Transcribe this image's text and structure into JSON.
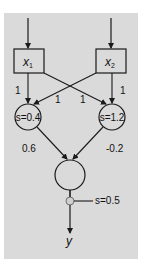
{
  "colors": {
    "panel": "#dadada",
    "line": "#1a1a1a",
    "background": "#ffffff",
    "threshold_node": "#d8d8d8"
  },
  "inputs": [
    {
      "name": "x",
      "subscript": "1"
    },
    {
      "name": "x",
      "subscript": "2"
    }
  ],
  "hidden_nodes": [
    {
      "label": "s=0.4"
    },
    {
      "label": "s=1.2"
    }
  ],
  "weights": {
    "x1_to_h1": "1",
    "x2_to_h1": "1",
    "x1_to_h2": "1",
    "x2_to_h2": "1",
    "h1_to_out": "0.6",
    "h2_to_out": "-0.2"
  },
  "output": {
    "threshold_label": "s=0.5",
    "output_label": "y"
  }
}
